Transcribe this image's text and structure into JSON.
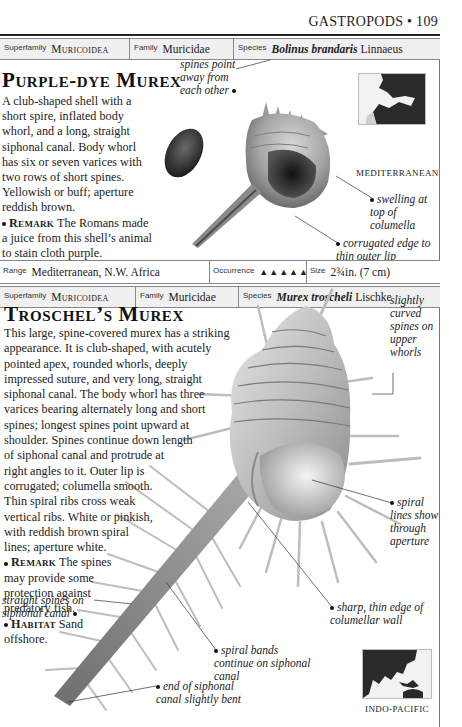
{
  "page": {
    "section": "GASTROPODS",
    "separator": "•",
    "page_number": "109"
  },
  "entries": [
    {
      "taxonomy": {
        "superfamily_label": "Superfamily",
        "superfamily": "Muricoidea",
        "family_label": "Family",
        "family": "Muricidae",
        "species_label": "Species",
        "species": "Bolinus brandaris",
        "authority": "Linnaeus"
      },
      "title": "Purple-dye Murex",
      "description": "A club-shaped shell with a short spire, inflated body whorl, and a long, straight siphonal canal. Body whorl has six or seven varices with two rows of short spines. Yellowish or buff; aperture reddish brown.",
      "remark_label": "Remark",
      "remark": "The Romans made a juice from this shell’s animal to stain cloth purple.",
      "habitat_label": "Habitat",
      "habitat": "Sand offshore.",
      "callouts": [
        "spines point away from each other",
        "swelling at top of columella",
        "corrugated edge to thin outer lip"
      ],
      "map_label": "MEDITERRANEAN",
      "footer": {
        "range_label": "Range",
        "range": "Mediterranean, N.W. Africa",
        "occurrence_label": "Occurrence",
        "occurrence_icons": "▲▲▲▲▲",
        "occurrence_count": 5,
        "size_label": "Size",
        "size": "2¾in. (7 cm)"
      }
    },
    {
      "taxonomy": {
        "superfamily_label": "Superfamily",
        "superfamily": "Muricoidea",
        "family_label": "Family",
        "family": "Muricidae",
        "species_label": "Species",
        "species": "Murex troscheli",
        "authority": "Lischke"
      },
      "title": "Troschel’s Murex",
      "description_lines": [
        "This large, spine-covered murex has a striking",
        "appearance. It is club-shaped, with acutely",
        "pointed apex, rounded whorls, deeply",
        "impressed suture, and very long, straight",
        "siphonal canal. The body whorl has three",
        "varices bearing alternately long and short",
        "spines; longest spines point upward at",
        "shoulder. Spines continue down length",
        "of siphonal canal and protrude at",
        "right angles to it. Outer lip is",
        "corrugated; columella smooth.",
        "Thin spiral ribs cross weak",
        "vertical ribs. White or pinkish,",
        "with reddish brown spiral",
        "lines; aperture white."
      ],
      "remark_label": "Remark",
      "remark_lines": [
        "The spines",
        "may provide some",
        "protection against",
        "predatory fish."
      ],
      "habitat_label": "Habitat",
      "habitat_lines": [
        "Sand",
        "offshore."
      ],
      "callouts": [
        "slightly curved spines on upper whorls",
        "spiral lines show through aperture",
        "straight spines on siphonal canal",
        "sharp, thin edge of columellar wall",
        "spiral bands continue on siphonal canal",
        "end of siphonal canal slightly bent"
      ],
      "map_label": "INDO-PACIFIC"
    }
  ],
  "colors": {
    "rule": "#222222",
    "taxonomy_bg": "#f0f0f0",
    "border": "#888888",
    "map_land": "#2a2a2a",
    "map_sea": "#f2f2f2"
  }
}
